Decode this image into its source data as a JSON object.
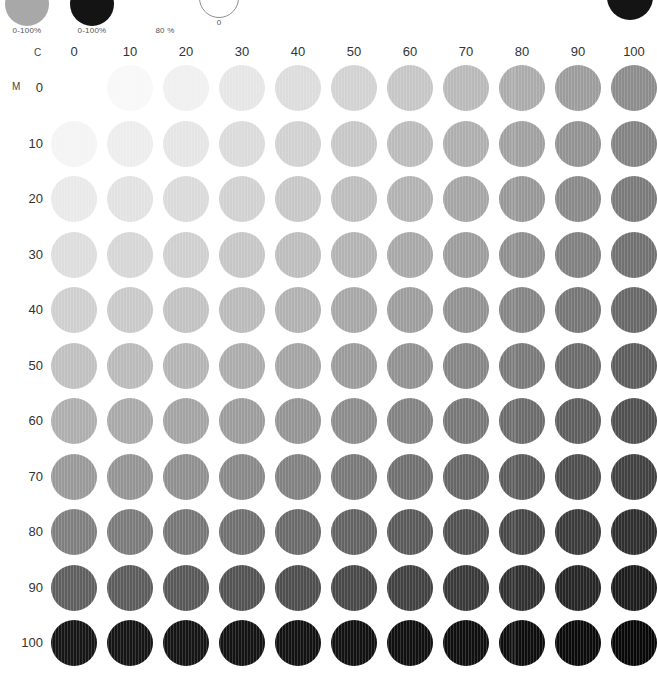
{
  "page": {
    "background": "#ffffff"
  },
  "top_strip": {
    "swatches": [
      {
        "name": "gray-solid-swatch",
        "label": "0-100%",
        "color": "#a8a8a8",
        "x": 5,
        "y": -18,
        "size": 44,
        "shape": "filled"
      },
      {
        "name": "black-solid-swatch",
        "label": "0-100%",
        "color": "#141414",
        "x": 70,
        "y": -18,
        "size": 44,
        "shape": "filled"
      },
      {
        "name": "tint-percent-label",
        "label": "80 %",
        "color": "#ffffff",
        "x": 143,
        "y": -18,
        "size": 44,
        "shape": "none"
      },
      {
        "name": "outline-zero-swatch",
        "label": "0",
        "color": "#ffffff",
        "x": 199,
        "y": -22,
        "size": 40,
        "shape": "outline"
      },
      {
        "name": "black-corner-swatch",
        "label": "",
        "color": "#141414",
        "x": 607,
        "y": -26,
        "size": 46,
        "shape": "filled"
      }
    ]
  },
  "chart_data": {
    "type": "heatmap",
    "xlabel": "C",
    "ylabel": "M",
    "categories_x": [
      "0",
      "10",
      "20",
      "30",
      "40",
      "50",
      "60",
      "70",
      "80",
      "90",
      "100"
    ],
    "categories_y": [
      "0",
      "10",
      "20",
      "30",
      "40",
      "50",
      "60",
      "70",
      "80",
      "90",
      "100"
    ],
    "legend": [],
    "grid": false,
    "cell_colors": [
      [
        "#ffffff",
        "#f8f8f8",
        "#f0f0f0",
        "#e6e6e6",
        "#dcdcdc",
        "#d2d2d2",
        "#c6c6c6",
        "#b9b9b9",
        "#ababab",
        "#9c9c9c",
        "#8c8c8c"
      ],
      [
        "#f4f4f4",
        "#ededed",
        "#e5e5e5",
        "#dbdbdb",
        "#d1d1d1",
        "#c7c7c7",
        "#bbbbbb",
        "#aeaeae",
        "#a0a0a0",
        "#929292",
        "#838383"
      ],
      [
        "#e9e9e9",
        "#e2e2e2",
        "#dadada",
        "#d1d1d1",
        "#c7c7c7",
        "#bdbdbd",
        "#b2b2b2",
        "#a5a5a5",
        "#979797",
        "#898989",
        "#7a7a7a"
      ],
      [
        "#dddddd",
        "#d6d6d6",
        "#cfcfcf",
        "#c6c6c6",
        "#bdbdbd",
        "#b3b3b3",
        "#a8a8a8",
        "#9c9c9c",
        "#8e8e8e",
        "#808080",
        "#717171"
      ],
      [
        "#cfcfcf",
        "#c9c9c9",
        "#c2c2c2",
        "#bababa",
        "#b1b1b1",
        "#a7a7a7",
        "#9d9d9d",
        "#919191",
        "#848484",
        "#767676",
        "#686868"
      ],
      [
        "#c0c0c0",
        "#bababa",
        "#b4b4b4",
        "#acacac",
        "#a4a4a4",
        "#9b9b9b",
        "#919191",
        "#858585",
        "#797979",
        "#6b6b6b",
        "#5d5d5d"
      ],
      [
        "#aeaeae",
        "#a9a9a9",
        "#a3a3a3",
        "#9c9c9c",
        "#949494",
        "#8c8c8c",
        "#828282",
        "#777777",
        "#6b6b6b",
        "#5e5e5e",
        "#505050"
      ],
      [
        "#999999",
        "#949494",
        "#8f8f8f",
        "#888888",
        "#818181",
        "#797979",
        "#707070",
        "#666666",
        "#5b5b5b",
        "#4e4e4e",
        "#414141"
      ],
      [
        "#7f7f7f",
        "#7b7b7b",
        "#767676",
        "#707070",
        "#6a6a6a",
        "#636363",
        "#5a5a5a",
        "#515151",
        "#474747",
        "#3b3b3b",
        "#2f2f2f"
      ],
      [
        "#5f5f5f",
        "#5c5c5c",
        "#585858",
        "#535353",
        "#4e4e4e",
        "#484848",
        "#414141",
        "#393939",
        "#303030",
        "#262626",
        "#1c1c1c"
      ],
      [
        "#161616",
        "#151515",
        "#141414",
        "#131313",
        "#121212",
        "#111111",
        "#101010",
        "#0f0f0f",
        "#0d0d0d",
        "#0b0b0b",
        "#080808"
      ]
    ]
  },
  "axes": {
    "x_letter": "C",
    "y_letter": "M"
  },
  "geometry": {
    "grid_left": 51,
    "grid_top": 25,
    "cell_step_x": 56,
    "cell_step_y": 55.5,
    "disc_size": 46,
    "label_row_y": 5
  }
}
